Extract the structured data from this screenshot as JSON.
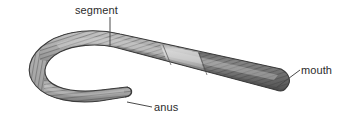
{
  "figure": {
    "background_color": "#ffffff",
    "width": 349,
    "height": 128
  },
  "labels": [
    {
      "id": "segment",
      "text": "segment",
      "leader": "vertical-line-down",
      "x": 75,
      "y": 4
    },
    {
      "id": "mouth",
      "text": "mouth",
      "leader": "diagonal-line-down-left",
      "x": 301,
      "y": 64
    },
    {
      "id": "anus",
      "text": "anus",
      "leader": "horizontal-line-left",
      "x": 154,
      "y": 101
    }
  ],
  "colors": {
    "body_light": "#b4b4b4",
    "body_mid": "#9a9a9a",
    "body_dark": "#6e6e6e",
    "head_dark": "#5a5a5a",
    "clitellum": "#b9b9b9",
    "outline": "#3c3c3c",
    "leader_line": "#4a4a4a",
    "label_text": "#2b2b2b",
    "background": "#ffffff"
  },
  "body_parts": [
    {
      "name": "tail-end",
      "description": "blunt posterior tip bearing the anus"
    },
    {
      "name": "posterior-body",
      "description": "lower segmented limb of the U-bend"
    },
    {
      "name": "u-bend",
      "description": "hairpin curve at the left of the figure"
    },
    {
      "name": "anterior-body",
      "description": "segmented trunk running down to the right"
    },
    {
      "name": "clitellum",
      "description": "smooth swollen pale band near the middle"
    },
    {
      "name": "head-end",
      "description": "dark rounded anterior tip bearing the mouth"
    }
  ]
}
